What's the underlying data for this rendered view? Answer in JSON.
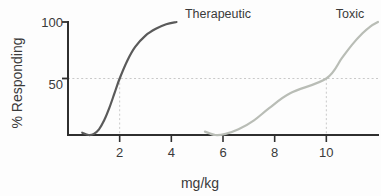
{
  "chart_data": {
    "type": "line",
    "title": "",
    "xlabel": "mg/kg",
    "ylabel": "% Responding",
    "grid": false,
    "legend_position": "inline-above-curves",
    "xlim": [
      0,
      12
    ],
    "ylim": [
      0,
      100
    ],
    "x_ticks": [
      {
        "label": "2",
        "value": 2,
        "muted": true
      },
      {
        "label": "4",
        "value": 4,
        "muted": false
      },
      {
        "label": "6",
        "value": 6,
        "muted": false
      },
      {
        "label": "8",
        "value": 8,
        "muted": false
      },
      {
        "label": "10",
        "value": 10,
        "muted": true
      }
    ],
    "y_ticks": [
      {
        "label": "50",
        "value": 50
      },
      {
        "label": "100",
        "value": 100
      }
    ],
    "reference_lines": [
      {
        "name": "fifty-percent-line",
        "orientation": "horizontal",
        "value": 50
      },
      {
        "name": "ed50-drop-line",
        "orientation": "vertical",
        "value": 2
      },
      {
        "name": "td50-drop-line",
        "orientation": "vertical",
        "value": 10
      }
    ],
    "series": [
      {
        "name": "Therapeutic",
        "color": "#5a5a5a",
        "ec50": 2,
        "points": [
          {
            "x": 0.55,
            "y": 2
          },
          {
            "x": 0.8,
            "y": 0
          },
          {
            "x": 1.0,
            "y": 1
          },
          {
            "x": 1.2,
            "y": 5
          },
          {
            "x": 1.4,
            "y": 13
          },
          {
            "x": 1.6,
            "y": 24
          },
          {
            "x": 1.8,
            "y": 37
          },
          {
            "x": 2.0,
            "y": 50
          },
          {
            "x": 2.3,
            "y": 66
          },
          {
            "x": 2.6,
            "y": 78
          },
          {
            "x": 3.0,
            "y": 88
          },
          {
            "x": 3.4,
            "y": 94
          },
          {
            "x": 3.8,
            "y": 98
          },
          {
            "x": 4.2,
            "y": 100
          }
        ]
      },
      {
        "name": "Toxic",
        "color": "#b9bdb6",
        "ec50": 10,
        "points": [
          {
            "x": 5.3,
            "y": 3
          },
          {
            "x": 5.7,
            "y": 0
          },
          {
            "x": 6.1,
            "y": 1
          },
          {
            "x": 6.6,
            "y": 5
          },
          {
            "x": 7.2,
            "y": 13
          },
          {
            "x": 7.8,
            "y": 24
          },
          {
            "x": 8.6,
            "y": 37
          },
          {
            "x": 10.0,
            "y": 50
          },
          {
            "x": 10.6,
            "y": 68
          },
          {
            "x": 11.0,
            "y": 80
          },
          {
            "x": 11.4,
            "y": 90
          },
          {
            "x": 11.7,
            "y": 96
          },
          {
            "x": 12.0,
            "y": 100
          }
        ]
      }
    ],
    "annotations": [
      {
        "name": "therapeutic-curve-label",
        "text": "Therapeutic",
        "color": "#3a3a3a"
      },
      {
        "name": "toxic-curve-label",
        "text": "Toxic",
        "color": "#3a3a3a"
      }
    ],
    "colors": {
      "background": "#fdfdfd",
      "axis": "#2f2f2f",
      "therapeutic": "#5a5a5a",
      "toxic": "#b9bdb6",
      "guide": "#c9c9c9",
      "tick_label": "#3a3a3a",
      "tick_label_muted": "#a9aca6"
    }
  }
}
